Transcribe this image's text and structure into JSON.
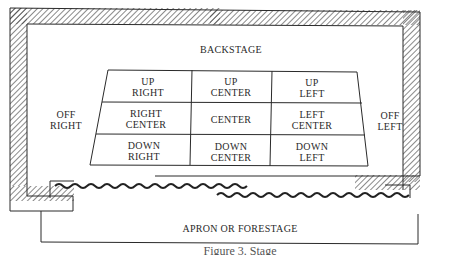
{
  "diagram": {
    "type": "stage-areas-plan",
    "labels": {
      "backstage": "BACKSTAGE",
      "off_right": [
        "OFF",
        "RIGHT"
      ],
      "off_left": [
        "OFF",
        "LEFT"
      ],
      "apron": "APRON OR FORESTAGE"
    },
    "grid": {
      "rows": [
        [
          {
            "l1": "UP",
            "l2": "RIGHT"
          },
          {
            "l1": "UP",
            "l2": "CENTER"
          },
          {
            "l1": "UP",
            "l2": "LEFT"
          }
        ],
        [
          {
            "l1": "RIGHT",
            "l2": "CENTER"
          },
          {
            "l1": "CENTER",
            "l2": ""
          },
          {
            "l1": "LEFT",
            "l2": "CENTER"
          }
        ],
        [
          {
            "l1": "DOWN",
            "l2": "RIGHT"
          },
          {
            "l1": "DOWN",
            "l2": "CENTER"
          },
          {
            "l1": "DOWN",
            "l2": "LEFT"
          }
        ]
      ]
    },
    "caption": "Figure 3. Stage",
    "colors": {
      "line": "#2a2a2a",
      "hatch": "#3a3a3a",
      "background": "#ffffff"
    }
  }
}
